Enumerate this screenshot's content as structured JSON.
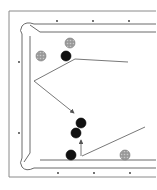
{
  "diagram": {
    "type": "billiards-table-shot-diagram",
    "colors": {
      "background": "#ffffff",
      "rail_line": "#6a6a6a",
      "frame_line": "#8a8a8a",
      "diamond": "#333333",
      "object_ball": "#111111",
      "striped_ball": "#8c8c8c",
      "path": "#555555"
    },
    "diamonds": {
      "top": [
        [
          57,
          21
        ],
        [
          93,
          21
        ],
        [
          129,
          21
        ]
      ],
      "left": [
        [
          19,
          62
        ],
        [
          19,
          133
        ]
      ],
      "bottom": [
        [
          58,
          173
        ],
        [
          94,
          173
        ],
        [
          130,
          173
        ]
      ]
    },
    "balls": [
      {
        "id": "gray-ball-1",
        "x": 41,
        "y": 56,
        "r": 5,
        "kind": "striped"
      },
      {
        "id": "gray-ball-2",
        "x": 70,
        "y": 43,
        "r": 5,
        "kind": "striped"
      },
      {
        "id": "black-ball-1",
        "x": 66,
        "y": 56,
        "r": 5,
        "kind": "solid"
      },
      {
        "id": "black-ball-2",
        "x": 81,
        "y": 123,
        "r": 5,
        "kind": "solid"
      },
      {
        "id": "black-ball-3",
        "x": 76,
        "y": 133,
        "r": 5,
        "kind": "solid"
      },
      {
        "id": "black-ball-4",
        "x": 71,
        "y": 155,
        "r": 5,
        "kind": "solid"
      },
      {
        "id": "gray-ball-3",
        "x": 125,
        "y": 155,
        "r": 5,
        "kind": "striped"
      }
    ],
    "paths": [
      {
        "id": "path-top",
        "points": "128,62 75,59 34,81"
      },
      {
        "id": "path-arrow-down",
        "points": "34,81 74,113"
      },
      {
        "id": "path-bottom",
        "points": "82,156 145,127"
      },
      {
        "id": "path-arrow-up",
        "points": "81,156 81,140"
      }
    ]
  }
}
